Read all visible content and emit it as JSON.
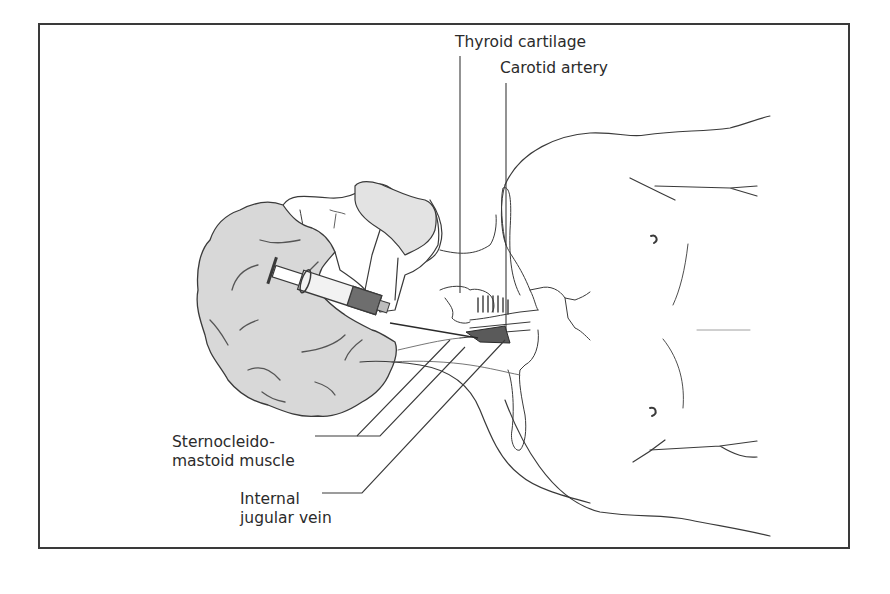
{
  "figure": {
    "labels": {
      "thyroid_cartilage": "Thyroid cartilage",
      "carotid_artery": "Carotid artery",
      "sternocleidomastoid_line1": "Sternocleido-",
      "sternocleidomastoid_line2": "mastoid muscle",
      "internal_jugular_line1": "Internal",
      "internal_jugular_line2": "jugular vein"
    },
    "colors": {
      "frame": "#3a3a3a",
      "line": "#3a3a3a",
      "hair_fill": "#d9d9d9",
      "face_fill": "#e6e6e6",
      "syringe_dark": "#6e6e6e",
      "vein_fill": "#5a5a5a",
      "background": "#ffffff"
    },
    "objects": [
      "patient-head",
      "hair",
      "syringe",
      "needle",
      "thyroid-cartilage",
      "carotid-artery",
      "sternocleidomastoid-muscle",
      "internal-jugular-vein",
      "clavicle",
      "torso",
      "nipples"
    ]
  }
}
